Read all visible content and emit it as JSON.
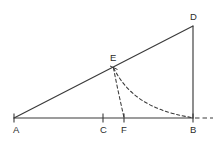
{
  "figure": {
    "type": "geometry-diagram",
    "canvas": {
      "width": 224,
      "height": 151
    },
    "colors": {
      "background": "#ffffff",
      "stroke": "#3a3a3a",
      "label": "#2b2b2b"
    },
    "points": {
      "A": {
        "label": "A",
        "x": 14,
        "y": 118,
        "label_x": 13,
        "label_y": 133
      },
      "B": {
        "label": "B",
        "x": 193,
        "y": 118,
        "label_x": 190,
        "label_y": 133
      },
      "C": {
        "label": "C",
        "x": 103,
        "y": 118,
        "label_x": 100,
        "label_y": 133
      },
      "D": {
        "label": "D",
        "x": 193,
        "y": 26,
        "label_x": 190,
        "label_y": 20
      },
      "E": {
        "label": "E",
        "x": 113,
        "y": 67,
        "label_x": 110,
        "label_y": 61
      },
      "F": {
        "label": "F",
        "x": 124,
        "y": 118,
        "label_x": 121,
        "label_y": 133
      }
    },
    "segments": [
      {
        "name": "hypotenuse-AD",
        "from": "A",
        "to": "D",
        "style": "solid"
      },
      {
        "name": "base-AB",
        "from": "A",
        "to": "B",
        "style": "solid"
      },
      {
        "name": "vertical-DB",
        "from": "D",
        "to": "B",
        "style": "solid"
      }
    ],
    "arcs": [
      {
        "name": "arc-E-to-B",
        "style": "dashed",
        "from": "E",
        "to": "B"
      },
      {
        "name": "arc-E-to-F",
        "style": "dashed",
        "from": "E",
        "to": "F"
      }
    ],
    "extensions": [
      {
        "name": "baseline-extension",
        "from": "B",
        "to_x": 213,
        "style": "dashed"
      }
    ],
    "tick_marks": [
      "A",
      "C",
      "F",
      "B"
    ]
  }
}
